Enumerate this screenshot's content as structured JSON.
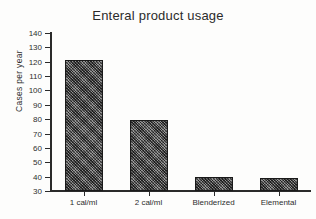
{
  "chart_data": {
    "type": "bar",
    "title": "Enteral product usage",
    "xlabel": "",
    "ylabel": "Cases per year",
    "categories": [
      "1 cal/ml",
      "2 cal/ml",
      "Blenderized",
      "Elemental"
    ],
    "values": [
      121,
      79.5,
      39.5,
      39
    ],
    "ylim": [
      30,
      140
    ],
    "yticks": [
      30,
      40,
      50,
      60,
      70,
      80,
      90,
      100,
      110,
      120,
      130,
      140
    ],
    "ytick_labels": [
      "30",
      "40",
      "50",
      "60",
      "70",
      "80",
      "90",
      "100",
      "110",
      "120",
      "130",
      "140"
    ],
    "grid": false,
    "legend": null,
    "series": [
      {
        "name": "Cases per year",
        "values": [
          121,
          79.5,
          39.5,
          39
        ]
      }
    ],
    "bar_color": "#6f6f6f",
    "bar_edge_color": "#1a1a1a",
    "axis_color": "#2a2a2a",
    "background_color": "#fdfdfc"
  }
}
